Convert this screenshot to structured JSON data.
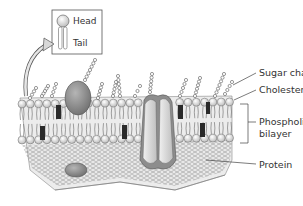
{
  "diagram": {
    "inset": {
      "head_label": "Head",
      "tail_label": "Tail"
    },
    "labels": {
      "sugar_chains": "Sugar chains",
      "cholesterol": "Cholesterol",
      "phospholipid_line1": "Phospholipid",
      "phospholipid_line2": "bilayer",
      "protein": "Protein"
    },
    "colors": {
      "membrane_base": "#e6e6e6",
      "head_fill": "#f2f2f2",
      "protein_fill": "#8c8c8c",
      "channel_fill": "#d9d9d9",
      "cholesterol_fill": "#2a2a2a",
      "line": "#444444"
    }
  }
}
